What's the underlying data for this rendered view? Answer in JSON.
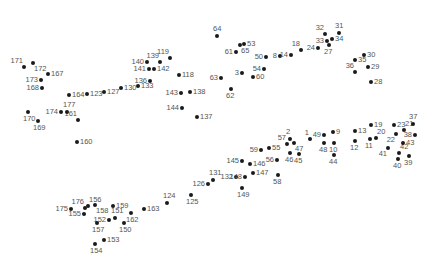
{
  "puzzle": {
    "type": "connect-the-dots",
    "dot_color": "#1a1a1a",
    "label_color": "#555555",
    "points": [
      {
        "n": "1",
        "x": 310,
        "y": 139,
        "pos": "ul"
      },
      {
        "n": "2",
        "x": 290,
        "y": 139,
        "pos": "u"
      },
      {
        "n": "3",
        "x": 242,
        "y": 73,
        "pos": "l"
      },
      {
        "n": "8",
        "x": 280,
        "y": 56,
        "pos": "l"
      },
      {
        "n": "9",
        "x": 333,
        "y": 132,
        "pos": "r"
      },
      {
        "n": "10",
        "x": 334,
        "y": 143,
        "pos": "d"
      },
      {
        "n": "11",
        "x": 370,
        "y": 139,
        "pos": "d"
      },
      {
        "n": "12",
        "x": 355,
        "y": 141,
        "pos": "d"
      },
      {
        "n": "13",
        "x": 355,
        "y": 131,
        "pos": "r"
      },
      {
        "n": "14",
        "x": 291,
        "y": 55,
        "pos": "l"
      },
      {
        "n": "18",
        "x": 301,
        "y": 50,
        "pos": "ul"
      },
      {
        "n": "19",
        "x": 371,
        "y": 125,
        "pos": "r"
      },
      {
        "n": "20",
        "x": 376,
        "y": 138,
        "pos": "ur"
      },
      {
        "n": "21",
        "x": 404,
        "y": 130,
        "pos": "ur"
      },
      {
        "n": "22",
        "x": 396,
        "y": 134,
        "pos": "dl"
      },
      {
        "n": "23",
        "x": 394,
        "y": 125,
        "pos": "r"
      },
      {
        "n": "24",
        "x": 318,
        "y": 48,
        "pos": "l"
      },
      {
        "n": "27",
        "x": 329,
        "y": 45,
        "pos": "d"
      },
      {
        "n": "28",
        "x": 371,
        "y": 82,
        "pos": "r"
      },
      {
        "n": "29",
        "x": 368,
        "y": 67,
        "pos": "r"
      },
      {
        "n": "30",
        "x": 364,
        "y": 55,
        "pos": "r"
      },
      {
        "n": "31",
        "x": 339,
        "y": 33,
        "pos": "u"
      },
      {
        "n": "32",
        "x": 325,
        "y": 34,
        "pos": "ul"
      },
      {
        "n": "33",
        "x": 327,
        "y": 41,
        "pos": "l"
      },
      {
        "n": "34",
        "x": 332,
        "y": 39,
        "pos": "r"
      },
      {
        "n": "35",
        "x": 355,
        "y": 60,
        "pos": "r"
      },
      {
        "n": "36",
        "x": 355,
        "y": 72,
        "pos": "ul"
      },
      {
        "n": "37",
        "x": 413,
        "y": 124,
        "pos": "u"
      },
      {
        "n": "38",
        "x": 415,
        "y": 135,
        "pos": "l"
      },
      {
        "n": "39",
        "x": 409,
        "y": 156,
        "pos": "d"
      },
      {
        "n": "40",
        "x": 398,
        "y": 159,
        "pos": "d"
      },
      {
        "n": "41",
        "x": 388,
        "y": 148,
        "pos": "dl"
      },
      {
        "n": "42",
        "x": 399,
        "y": 153,
        "pos": "ur"
      },
      {
        "n": "43",
        "x": 403,
        "y": 143,
        "pos": "r"
      },
      {
        "n": "44",
        "x": 334,
        "y": 155,
        "pos": "d"
      },
      {
        "n": "45",
        "x": 299,
        "y": 154,
        "pos": "d"
      },
      {
        "n": "46",
        "x": 290,
        "y": 153,
        "pos": "d"
      },
      {
        "n": "47",
        "x": 294,
        "y": 143,
        "pos": "dr"
      },
      {
        "n": "48",
        "x": 324,
        "y": 143,
        "pos": "d"
      },
      {
        "n": "49",
        "x": 324,
        "y": 135,
        "pos": "l"
      },
      {
        "n": "50",
        "x": 266,
        "y": 57,
        "pos": "l"
      },
      {
        "n": "53",
        "x": 244,
        "y": 44,
        "pos": "r"
      },
      {
        "n": "54",
        "x": 264,
        "y": 69,
        "pos": "l"
      },
      {
        "n": "55",
        "x": 269,
        "y": 148,
        "pos": "r"
      },
      {
        "n": "56",
        "x": 277,
        "y": 160,
        "pos": "l"
      },
      {
        "n": "57",
        "x": 287,
        "y": 144,
        "pos": "ul"
      },
      {
        "n": "58",
        "x": 278,
        "y": 175,
        "pos": "d"
      },
      {
        "n": "59",
        "x": 261,
        "y": 150,
        "pos": "l"
      },
      {
        "n": "60",
        "x": 253,
        "y": 77,
        "pos": "r"
      },
      {
        "n": "61",
        "x": 236,
        "y": 52,
        "pos": "l"
      },
      {
        "n": "62",
        "x": 231,
        "y": 89,
        "pos": "d"
      },
      {
        "n": "63",
        "x": 221,
        "y": 78,
        "pos": "l"
      },
      {
        "n": "64",
        "x": 217,
        "y": 36,
        "pos": "u"
      },
      {
        "n": "65",
        "x": 240,
        "y": 45,
        "pos": "dr"
      },
      {
        "n": "118",
        "x": 179,
        "y": 75,
        "pos": "r"
      },
      {
        "n": "119",
        "x": 170,
        "y": 58,
        "pos": "ul"
      },
      {
        "n": "123",
        "x": 87,
        "y": 94,
        "pos": "r"
      },
      {
        "n": "124",
        "x": 167,
        "y": 203,
        "pos": "u"
      },
      {
        "n": "125",
        "x": 191,
        "y": 195,
        "pos": "d"
      },
      {
        "n": "126",
        "x": 208,
        "y": 184,
        "pos": "l"
      },
      {
        "n": "127",
        "x": 104,
        "y": 92,
        "pos": "r"
      },
      {
        "n": "130",
        "x": 121,
        "y": 88,
        "pos": "r"
      },
      {
        "n": "131",
        "x": 213,
        "y": 180,
        "pos": "u"
      },
      {
        "n": "132",
        "x": 236,
        "y": 177,
        "pos": "l"
      },
      {
        "n": "133",
        "x": 138,
        "y": 86,
        "pos": "r"
      },
      {
        "n": "136",
        "x": 150,
        "y": 81,
        "pos": "l"
      },
      {
        "n": "137",
        "x": 197,
        "y": 117,
        "pos": "r"
      },
      {
        "n": "138",
        "x": 190,
        "y": 92,
        "pos": "r"
      },
      {
        "n": "139",
        "x": 160,
        "y": 62,
        "pos": "ul"
      },
      {
        "n": "140",
        "x": 147,
        "y": 62,
        "pos": "l"
      },
      {
        "n": "141",
        "x": 149,
        "y": 69,
        "pos": "l"
      },
      {
        "n": "142",
        "x": 154,
        "y": 69,
        "pos": "r"
      },
      {
        "n": "143",
        "x": 181,
        "y": 93,
        "pos": "l"
      },
      {
        "n": "144",
        "x": 182,
        "y": 108,
        "pos": "l"
      },
      {
        "n": "145",
        "x": 242,
        "y": 161,
        "pos": "l"
      },
      {
        "n": "146",
        "x": 250,
        "y": 164,
        "pos": "r"
      },
      {
        "n": "147",
        "x": 253,
        "y": 173,
        "pos": "r"
      },
      {
        "n": "148",
        "x": 245,
        "y": 177,
        "pos": "l"
      },
      {
        "n": "149",
        "x": 242,
        "y": 188,
        "pos": "d"
      },
      {
        "n": "150",
        "x": 124,
        "y": 223,
        "pos": "d"
      },
      {
        "n": "151",
        "x": 115,
        "y": 218,
        "pos": "u"
      },
      {
        "n": "152",
        "x": 109,
        "y": 220,
        "pos": "l"
      },
      {
        "n": "153",
        "x": 104,
        "y": 240,
        "pos": "r"
      },
      {
        "n": "154",
        "x": 95,
        "y": 244,
        "pos": "d"
      },
      {
        "n": "155",
        "x": 84,
        "y": 214,
        "pos": "l"
      },
      {
        "n": "156",
        "x": 88,
        "y": 206,
        "pos": "ur"
      },
      {
        "n": "157",
        "x": 97,
        "y": 223,
        "pos": "d"
      },
      {
        "n": "158",
        "x": 95,
        "y": 205,
        "pos": "dr"
      },
      {
        "n": "159",
        "x": 113,
        "y": 206,
        "pos": "r"
      },
      {
        "n": "160",
        "x": 77,
        "y": 142,
        "pos": "r"
      },
      {
        "n": "161",
        "x": 78,
        "y": 120,
        "pos": "ul"
      },
      {
        "n": "162",
        "x": 131,
        "y": 213,
        "pos": "d"
      },
      {
        "n": "163",
        "x": 144,
        "y": 209,
        "pos": "r"
      },
      {
        "n": "164",
        "x": 69,
        "y": 95,
        "pos": "r"
      },
      {
        "n": "167",
        "x": 48,
        "y": 74,
        "pos": "r"
      },
      {
        "n": "168",
        "x": 42,
        "y": 88,
        "pos": "l"
      },
      {
        "n": "169",
        "x": 38,
        "y": 121,
        "pos": "d"
      },
      {
        "n": "170",
        "x": 28,
        "y": 112,
        "pos": "d"
      },
      {
        "n": "171",
        "x": 24,
        "y": 67,
        "pos": "ul"
      },
      {
        "n": "172",
        "x": 33,
        "y": 63,
        "pos": "dr"
      },
      {
        "n": "173",
        "x": 41,
        "y": 80,
        "pos": "l"
      },
      {
        "n": "174",
        "x": 61,
        "y": 112,
        "pos": "l"
      },
      {
        "n": "175",
        "x": 71,
        "y": 209,
        "pos": "l"
      },
      {
        "n": "176",
        "x": 85,
        "y": 208,
        "pos": "ul"
      },
      {
        "n": "177",
        "x": 67,
        "y": 112,
        "pos": "u"
      }
    ]
  }
}
